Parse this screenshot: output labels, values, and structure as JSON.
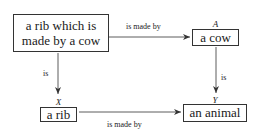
{
  "diagram": {
    "type": "commutative-square",
    "nodes": {
      "pullback": {
        "text": "a rib which is made by a cow",
        "line1": "a rib which is",
        "line2": "made by a cow",
        "object_label": "X ×Y A"
      },
      "cow": {
        "text": "a cow",
        "object_label": "A"
      },
      "rib": {
        "text": "a rib",
        "object_label": "X"
      },
      "animal": {
        "text": "an animal",
        "object_label": "Y"
      }
    },
    "label_parts": {
      "pullback_x": "X",
      "pullback_times": "×",
      "pullback_y": "Y",
      "pullback_a": "A"
    },
    "edges": [
      {
        "from": "pullback",
        "to": "cow",
        "label": "is made by"
      },
      {
        "from": "pullback",
        "to": "rib",
        "label": "is"
      },
      {
        "from": "cow",
        "to": "animal",
        "label": "is"
      },
      {
        "from": "rib",
        "to": "animal",
        "label": "is made by"
      }
    ]
  }
}
